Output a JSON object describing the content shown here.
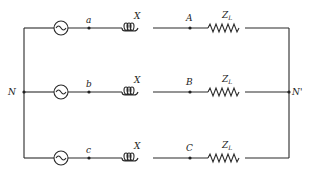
{
  "diagram": {
    "type": "three-phase circuit",
    "nodes": {
      "neutral_source": "N",
      "neutral_load": "N'"
    },
    "phases": [
      {
        "source_terminal": "a",
        "load_terminal": "A",
        "reactance_label": "X",
        "load_label": "Z",
        "load_sub": "L"
      },
      {
        "source_terminal": "b",
        "load_terminal": "B",
        "reactance_label": "X",
        "load_label": "Z",
        "load_sub": "L"
      },
      {
        "source_terminal": "c",
        "load_terminal": "C",
        "reactance_label": "X",
        "load_label": "Z",
        "load_sub": "L"
      }
    ],
    "colors": {
      "line": "#2a2a2a",
      "background": "#ffffff"
    }
  }
}
